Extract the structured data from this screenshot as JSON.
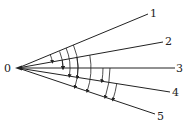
{
  "diagram": {
    "origin_label": "0",
    "rays": [
      {
        "label": "1",
        "end": [
          148,
          14
        ]
      },
      {
        "label": "2",
        "end": [
          163,
          42
        ]
      },
      {
        "label": "3",
        "end": [
          175,
          68
        ]
      },
      {
        "label": "4",
        "end": [
          170,
          92
        ]
      },
      {
        "label": "5",
        "end": [
          155,
          114
        ]
      }
    ],
    "colors": {
      "stroke": "#222222",
      "background": "#ffffff"
    }
  }
}
